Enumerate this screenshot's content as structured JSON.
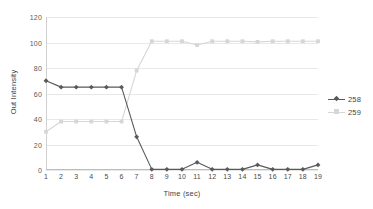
{
  "chart_data": {
    "type": "line",
    "title": "",
    "xlabel": "Time (sec)",
    "ylabel": "Out Intensity",
    "x": [
      1,
      2,
      3,
      4,
      5,
      6,
      7,
      8,
      9,
      10,
      11,
      12,
      13,
      14,
      15,
      16,
      17,
      18,
      19
    ],
    "xtick_labels": [
      "1",
      "2",
      "3",
      "4",
      "5",
      "6",
      "7",
      "8",
      "9",
      "10",
      "11",
      "12",
      "13",
      "14",
      "15",
      "16",
      "17",
      "18",
      "19"
    ],
    "ytick_labels": [
      "0",
      "20",
      "40",
      "60",
      "80",
      "100",
      "120"
    ],
    "yticks": [
      0,
      20,
      40,
      60,
      80,
      100,
      120
    ],
    "ylim": [
      0,
      120
    ],
    "xlim": [
      1,
      19
    ],
    "grid": "horizontal",
    "legend_position": "right",
    "series": [
      {
        "name": "258",
        "color": "#595959",
        "marker": "diamond",
        "values": [
          70,
          65,
          65,
          65,
          65,
          65,
          26,
          0.5,
          0.5,
          0.5,
          6,
          0.5,
          0.5,
          0.5,
          4,
          0.5,
          0.5,
          0.5,
          4
        ]
      },
      {
        "name": "259",
        "color": "#d6d6d6",
        "marker": "square",
        "values": [
          30,
          38,
          38,
          38,
          38,
          38,
          78,
          101,
          101,
          101,
          98,
          101,
          101,
          101,
          100.5,
          101,
          101,
          101,
          101
        ]
      }
    ]
  },
  "legend": {
    "items": [
      {
        "label": "258"
      },
      {
        "label": "259"
      }
    ]
  },
  "axes": {
    "x_title": "Time (sec)",
    "y_title": "Out Intensity"
  }
}
